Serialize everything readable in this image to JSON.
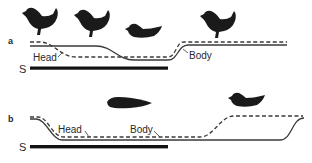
{
  "figure": {
    "panels": [
      {
        "id": "a",
        "label": "a",
        "stimulus_label": "S",
        "head_label": "Head",
        "body_label": "Body",
        "chickens": [
          "standing",
          "standing",
          "crouched",
          "standing"
        ]
      },
      {
        "id": "b",
        "label": "b",
        "stimulus_label": "S",
        "head_label": "Head",
        "body_label": "Body",
        "chickens": [
          "crouched-flat",
          "crouched"
        ]
      }
    ],
    "legend": {
      "solid_line": "Body",
      "dashed_line": "Head"
    },
    "colors": {
      "ink": "#1a1a1a",
      "line": "#3a3a3a",
      "background": "#ffffff"
    }
  }
}
